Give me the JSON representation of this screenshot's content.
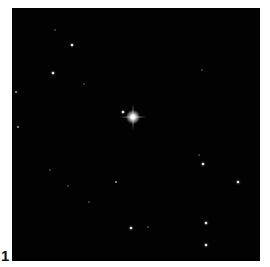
{
  "figure": {
    "panel_label": "1",
    "background_color": "#020202",
    "central_star": {
      "x": 121,
      "y": 109,
      "type": "bright"
    },
    "stars": [
      {
        "x": 111,
        "y": 104,
        "type": "medium"
      },
      {
        "x": 60,
        "y": 37,
        "type": "medium"
      },
      {
        "x": 43,
        "y": 22,
        "type": "dim"
      },
      {
        "x": 41,
        "y": 65,
        "type": "medium"
      },
      {
        "x": 4,
        "y": 84,
        "type": "faint"
      },
      {
        "x": 6,
        "y": 119,
        "type": "faint"
      },
      {
        "x": 72,
        "y": 76,
        "type": "dim"
      },
      {
        "x": 190,
        "y": 62,
        "type": "dim"
      },
      {
        "x": 187,
        "y": 147,
        "type": "dim"
      },
      {
        "x": 191,
        "y": 156,
        "type": "medium"
      },
      {
        "x": 226,
        "y": 174,
        "type": "medium"
      },
      {
        "x": 104,
        "y": 174,
        "type": "faint"
      },
      {
        "x": 38,
        "y": 162,
        "type": "dim"
      },
      {
        "x": 56,
        "y": 178,
        "type": "dim"
      },
      {
        "x": 77,
        "y": 194,
        "type": "dim"
      },
      {
        "x": 119,
        "y": 220,
        "type": "medium"
      },
      {
        "x": 136,
        "y": 219,
        "type": "dim"
      },
      {
        "x": 194,
        "y": 215,
        "type": "medium"
      },
      {
        "x": 194,
        "y": 237,
        "type": "medium"
      }
    ]
  }
}
